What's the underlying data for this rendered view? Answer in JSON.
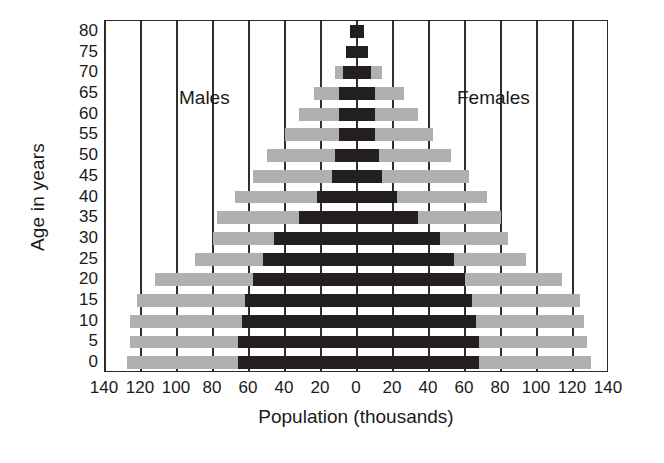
{
  "chart_data": {
    "type": "bar",
    "subtype": "population-pyramid",
    "title": "",
    "xlabel": "Population (thousands)",
    "ylabel": "Age in years",
    "grid": true,
    "legend_position": "inside-plot",
    "orientation": "horizontal",
    "center_value": 0,
    "xlim": [
      -140,
      140
    ],
    "x_unit_step": 20,
    "xticks": [
      140,
      120,
      100,
      80,
      60,
      40,
      20,
      0,
      20,
      40,
      60,
      80,
      100,
      120,
      140
    ],
    "xtick_signed": [
      -140,
      -120,
      -100,
      -80,
      -60,
      -40,
      -20,
      0,
      20,
      40,
      60,
      80,
      100,
      120,
      140
    ],
    "categories": [
      "80",
      "75",
      "70",
      "65",
      "60",
      "55",
      "50",
      "45",
      "40",
      "35",
      "30",
      "25",
      "20",
      "15",
      "10",
      "5",
      "0"
    ],
    "series": [
      {
        "name": "Males",
        "side": "left",
        "color": "#b0b0b0",
        "layer": "outer",
        "values": [
          4,
          6,
          12,
          24,
          32,
          40,
          50,
          58,
          68,
          78,
          80,
          90,
          112,
          122,
          126,
          126,
          128
        ]
      },
      {
        "name": "Males",
        "side": "left",
        "color": "#231f20",
        "layer": "inner",
        "values": [
          4,
          6,
          8,
          10,
          10,
          10,
          12,
          14,
          22,
          32,
          46,
          52,
          58,
          62,
          64,
          66,
          66
        ]
      },
      {
        "name": "Females",
        "side": "right",
        "color": "#b0b0b0",
        "layer": "outer",
        "values": [
          4,
          6,
          14,
          26,
          34,
          42,
          52,
          62,
          72,
          80,
          84,
          94,
          114,
          124,
          126,
          128,
          130
        ]
      },
      {
        "name": "Females",
        "side": "right",
        "color": "#231f20",
        "layer": "inner",
        "values": [
          4,
          6,
          8,
          10,
          10,
          10,
          12,
          14,
          22,
          34,
          46,
          54,
          60,
          64,
          66,
          68,
          68
        ]
      }
    ],
    "annotations": [
      {
        "text": "Males",
        "x": -80,
        "y": "65"
      },
      {
        "text": "Females",
        "x": 74,
        "y": "65"
      }
    ]
  },
  "colors": {
    "outer_bar": "#b0b0b0",
    "inner_bar": "#231f20",
    "axis": "#2a2a2a",
    "grid": "#2f2f2f",
    "text": "#1a1a1a",
    "background": "#ffffff"
  },
  "axes": {
    "x_title": "Population (thousands)",
    "y_title": "Age in years"
  },
  "captions": {
    "males": "Males",
    "females": "Females"
  }
}
